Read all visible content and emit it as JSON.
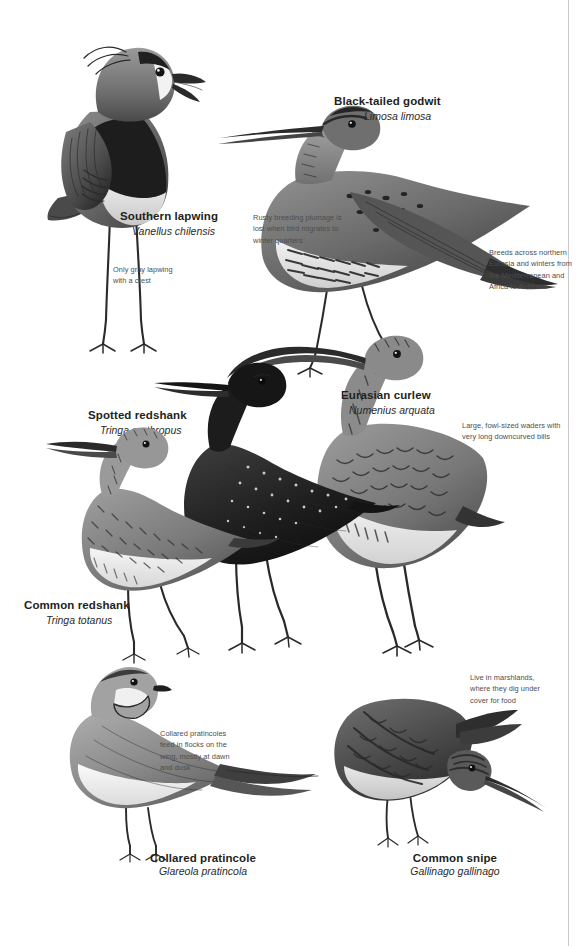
{
  "page": {
    "kind": "field-guide-plate",
    "subject": "waders",
    "background_color": "#ffffff",
    "ink_color": "#231f20",
    "note_color": "#4d4d4f",
    "gutter_rule_color": "#c9c9c9"
  },
  "species": [
    {
      "id": "southern-lapwing",
      "common": "Southern lapwing",
      "scientific": "Vanellus chilensis"
    },
    {
      "id": "black-tailed-godwit",
      "common": "Black-tailed godwit",
      "scientific": "Limosa limosa"
    },
    {
      "id": "spotted-redshank",
      "common": "Spotted redshank",
      "scientific": "Tringa erythropus"
    },
    {
      "id": "eurasian-curlew",
      "common": "Eurasian curlew",
      "scientific": "Numenius arquata"
    },
    {
      "id": "common-redshank",
      "common": "Common redshank",
      "scientific": "Tringa totanus"
    },
    {
      "id": "collared-pratincole",
      "common": "Collared pratincole",
      "scientific": "Glareola pratincola"
    },
    {
      "id": "common-snipe",
      "common": "Common snipe",
      "scientific": "Gallinago gallinago"
    }
  ],
  "notes": {
    "lapwing_crest": "Only gray lapwing\nwith a crest",
    "godwit_plumage": "Rusty breeding plumage is\nlost when bird migrates to\nwinter quarters",
    "godwit_range": "Breeds across northern\nEurasia and winters from\nthe Mediterranean and\nAfrica to Australia",
    "curlew_bill": "Large, fowl-sized waders with\nvery long downcurved bills",
    "pratincole_feeding": "Collared pratincoles\nfeed in flocks on the\nwing, mostly at dawn\nand dusk",
    "snipe_habitat": "Live in marshlands,\nwhere they dig under\ncover for food"
  }
}
